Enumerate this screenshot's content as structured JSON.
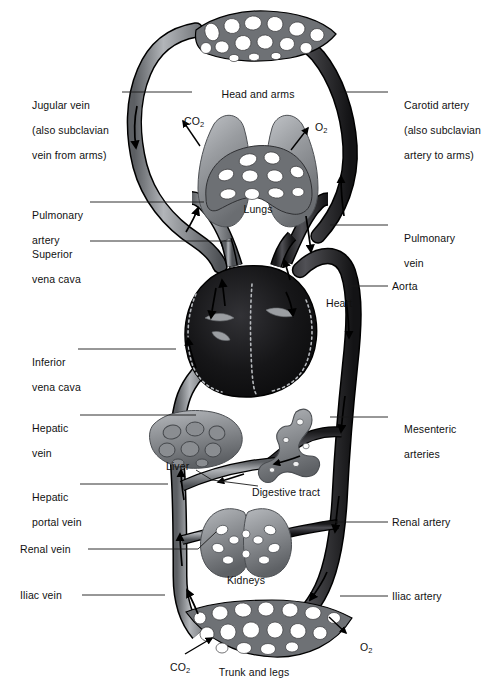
{
  "diagram": {
    "type": "anatomical-schematic",
    "background": "#ffffff",
    "colors": {
      "artery_dark": "#2c2c2e",
      "artery_mid": "#3d3d40",
      "vein_grey": "#7e8185",
      "vein_light": "#a9acb0",
      "organ_grey": "#96999d",
      "organ_dark": "#6b6e72",
      "heart_dark": "#1b1b1d",
      "outline": "#000000",
      "label_text": "#111111"
    }
  },
  "labels_left": [
    {
      "id": "jugular-vein",
      "lines": [
        "Jugular vein",
        "(also subclavian",
        "vein from arms)"
      ],
      "x": 20,
      "y": 86,
      "leader_from": [
        122,
        92
      ],
      "leader_to": [
        192,
        92
      ]
    },
    {
      "id": "pulmonary-artery",
      "lines": [
        "Pulmonary",
        "artery"
      ],
      "x": 20,
      "y": 196,
      "leader_from": [
        90,
        202
      ],
      "leader_to": [
        204,
        202
      ]
    },
    {
      "id": "superior-vena-cava",
      "lines": [
        "Superior",
        "vena cava"
      ],
      "x": 20,
      "y": 235,
      "leader_from": [
        90,
        241
      ],
      "leader_to": [
        233,
        241
      ]
    },
    {
      "id": "inferior-vena-cava",
      "lines": [
        "Inferior",
        "vena cava"
      ],
      "x": 20,
      "y": 343,
      "leader_from": [
        78,
        349
      ],
      "leader_to": [
        176,
        349
      ]
    },
    {
      "id": "hepatic-vein",
      "lines": [
        "Hepatic",
        "vein"
      ],
      "x": 20,
      "y": 409,
      "leader_from": [
        80,
        415
      ],
      "leader_to": [
        196,
        415
      ]
    },
    {
      "id": "hepatic-portal-vein",
      "lines": [
        "Hepatic",
        "portal vein"
      ],
      "x": 20,
      "y": 478,
      "leader_from": [
        80,
        484
      ],
      "leader_to": [
        168,
        484
      ]
    },
    {
      "id": "renal-vein",
      "lines": [
        "Renal vein"
      ],
      "x": 20,
      "y": 545,
      "leader_from": [
        88,
        549
      ],
      "leader_to": [
        205,
        549
      ]
    },
    {
      "id": "iliac-vein",
      "lines": [
        "Iliac vein"
      ],
      "x": 20,
      "y": 591,
      "leader_from": [
        82,
        595
      ],
      "leader_to": [
        165,
        595
      ]
    }
  ],
  "labels_right": [
    {
      "id": "carotid-artery",
      "lines": [
        "Carotid artery",
        "(also subclavian",
        "artery to arms)"
      ],
      "x": 392,
      "y": 86,
      "leader_from": [
        340,
        92
      ],
      "leader_to": [
        388,
        92
      ]
    },
    {
      "id": "pulmonary-vein",
      "lines": [
        "Pulmonary",
        "vein"
      ],
      "x": 392,
      "y": 221,
      "leader_from": [
        330,
        225
      ],
      "leader_to": [
        388,
        225
      ]
    },
    {
      "id": "aorta",
      "lines": [
        "Aorta"
      ],
      "x": 392,
      "y": 282,
      "leader_from": [
        348,
        286
      ],
      "leader_to": [
        388,
        286
      ]
    },
    {
      "id": "mesenteric-arteries",
      "lines": [
        "Mesenteric",
        "arteries"
      ],
      "x": 392,
      "y": 412,
      "leader_from": [
        330,
        417
      ],
      "leader_to": [
        388,
        417
      ]
    },
    {
      "id": "renal-artery",
      "lines": [
        "Renal artery"
      ],
      "x": 392,
      "y": 518,
      "leader_from": [
        322,
        522
      ],
      "leader_to": [
        388,
        522
      ]
    },
    {
      "id": "iliac-artery",
      "lines": [
        "Iliac artery"
      ],
      "x": 392,
      "y": 592,
      "leader_from": [
        340,
        596
      ],
      "leader_to": [
        388,
        596
      ]
    }
  ],
  "organ_labels": [
    {
      "id": "head-and-arms",
      "text": "Head and arms",
      "x": 258,
      "y": 95,
      "align": "center"
    },
    {
      "id": "lungs",
      "text": "Lungs",
      "x": 258,
      "y": 210,
      "align": "center"
    },
    {
      "id": "heart",
      "text": "Heart",
      "x": 325,
      "y": 304,
      "align": "left"
    },
    {
      "id": "liver",
      "text": "Liver",
      "x": 186,
      "y": 466,
      "align": "left"
    },
    {
      "id": "digestive-tract",
      "text": "Digestive tract",
      "x": 258,
      "y": 492,
      "align": "left"
    },
    {
      "id": "kidneys",
      "text": "Kidneys",
      "x": 244,
      "y": 581,
      "align": "center"
    },
    {
      "id": "trunk-and-legs",
      "text": "Trunk and legs",
      "x": 250,
      "y": 673,
      "align": "center"
    }
  ],
  "gas_labels": [
    {
      "id": "co2-lungs",
      "base": "CO",
      "sub": "2",
      "x": 175,
      "y": 107,
      "arrow_from": [
        196,
        143
      ],
      "arrow_to": [
        180,
        120
      ]
    },
    {
      "id": "o2-lungs",
      "base": "O",
      "sub": "2",
      "x": 303,
      "y": 113,
      "arrow_from": [
        293,
        148
      ],
      "arrow_to": [
        308,
        126
      ]
    },
    {
      "id": "co2-trunk",
      "base": "CO",
      "sub": "2",
      "x": 162,
      "y": 652,
      "arrow_from": [
        186,
        655
      ],
      "arrow_to": [
        212,
        637
      ]
    },
    {
      "id": "o2-trunk",
      "base": "O",
      "sub": "2",
      "x": 348,
      "y": 632,
      "arrow_from": [
        330,
        618
      ],
      "arrow_to": [
        345,
        634
      ]
    }
  ]
}
